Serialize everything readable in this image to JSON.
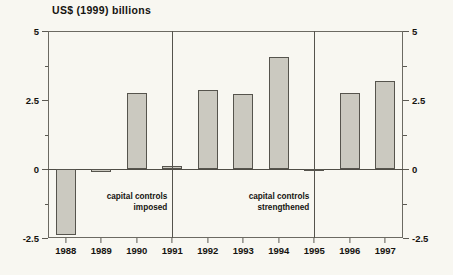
{
  "chart_data": {
    "type": "bar",
    "title": "US$ (1999) billions",
    "xlabel": "",
    "ylabel": "US$ (1999) billions",
    "categories": [
      "1988",
      "1989",
      "1990",
      "1991",
      "1992",
      "1993",
      "1994",
      "1995",
      "1996",
      "1997"
    ],
    "values": [
      -2.4,
      -0.1,
      2.75,
      0.12,
      2.85,
      2.7,
      4.05,
      -0.05,
      2.75,
      3.2
    ],
    "series": [
      {
        "name": "capital flows",
        "values": [
          -2.4,
          -0.1,
          2.75,
          0.12,
          2.85,
          2.7,
          4.05,
          -0.05,
          2.75,
          3.2
        ]
      }
    ],
    "ylim": [
      -2.5,
      5
    ],
    "ytick_labels": [
      "5",
      "2.5",
      "0",
      "-2.5"
    ],
    "ytick_values": [
      5,
      2.5,
      0,
      -2.5
    ],
    "yminor_values": [
      3.75,
      1.25,
      -1.25
    ],
    "grid": false,
    "legend": "none",
    "dual_axis": true,
    "annotations": [
      {
        "id": "capital-controls-imposed",
        "line1": "capital controls",
        "line2": "imposed",
        "at_x": 1990.5
      },
      {
        "id": "capital-controls-strengthened",
        "line1": "capital controls",
        "line2": "strengthened",
        "at_x": 1994.5
      }
    ],
    "dividers": [
      1991,
      1995
    ],
    "colors": {
      "background": "#f8f7f1",
      "bar_fill": "#cbc9c0",
      "bar_edge": "#56544d",
      "axis": "#5b5952",
      "text": "#15130f"
    }
  }
}
